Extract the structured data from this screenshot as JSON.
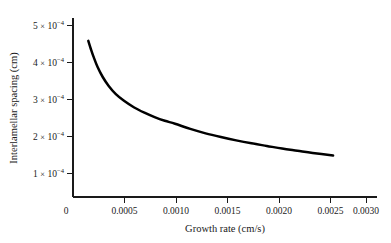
{
  "chart_data": {
    "type": "line",
    "title": "",
    "xlabel": "Growth rate (cm/s)",
    "ylabel": "Interlamellar spacing (cm)",
    "xlim": [
      0,
      0.0032
    ],
    "ylim": [
      0,
      0.00054
    ],
    "grid": false,
    "legend": null,
    "xticks": [
      0,
      0.0005,
      0.001,
      0.0015,
      0.002,
      0.0025,
      0.003
    ],
    "xtick_labels": [
      "0",
      "0.0005",
      "0.0010",
      "0.0015",
      "0.0020",
      "0.0025",
      "0.0030"
    ],
    "yticks": [
      0.0001,
      0.0002,
      0.0003,
      0.0004,
      0.0005
    ],
    "ytick_labels": [
      {
        "mantissa": "1",
        "times": "×",
        "base": "10",
        "exponent": "−4"
      },
      {
        "mantissa": "2",
        "times": "×",
        "base": "10",
        "exponent": "−4"
      },
      {
        "mantissa": "3",
        "times": "×",
        "base": "10",
        "exponent": "−4"
      },
      {
        "mantissa": "4",
        "times": "×",
        "base": "10",
        "exponent": "−4"
      },
      {
        "mantissa": "5",
        "times": "×",
        "base": "10",
        "exponent": "−4"
      }
    ],
    "series": [
      {
        "name": "Interlamellar spacing vs growth rate",
        "color": "#000000",
        "x": [
          0.00015,
          0.000175,
          0.0002,
          0.00024,
          0.00029,
          0.00035,
          0.00042,
          0.0005,
          0.0006,
          0.0007,
          0.0008,
          0.0009,
          0.001,
          0.00115,
          0.0013,
          0.00145,
          0.0016,
          0.00175,
          0.0019,
          0.00205,
          0.0022,
          0.00235,
          0.00255
        ],
        "y": [
          0.000422,
          0.0004,
          0.00038,
          0.000352,
          0.000325,
          0.0003,
          0.000278,
          0.00026,
          0.000242,
          0.000228,
          0.000216,
          0.000206,
          0.000198,
          0.000184,
          0.000172,
          0.000162,
          0.000153,
          0.000145,
          0.000138,
          0.000131,
          0.000125,
          0.000119,
          0.000112
        ]
      }
    ]
  },
  "axes_geometry": {
    "origin_x": 73,
    "origin_y": 197,
    "x_pixels_per_unit": 102000,
    "y_pixels_per_unit": 370000
  }
}
